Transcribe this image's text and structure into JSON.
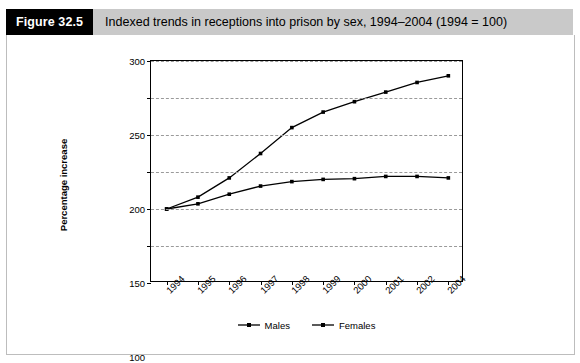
{
  "header": {
    "figure_label": "Figure 32.5",
    "figure_title": "Indexed trends in receptions into prison by sex, 1994–2004 (1994 = 100)"
  },
  "chart_data": {
    "type": "line",
    "title": "Indexed trends in receptions into prison by sex, 1994–2004 (1994 = 100)",
    "xlabel": "",
    "ylabel": "Percentage increase",
    "categories": [
      "1994",
      "1995",
      "1996",
      "1997",
      "1998",
      "1999",
      "2000",
      "2001",
      "2002",
      "2004"
    ],
    "ylim": [
      0,
      300
    ],
    "yticks": [
      0,
      50,
      100,
      150,
      200,
      250,
      300
    ],
    "grid": true,
    "legend_position": "bottom",
    "series": [
      {
        "name": "Males",
        "values": [
          100,
          107,
          120,
          131,
          137,
          140,
          141,
          144,
          144,
          142
        ]
      },
      {
        "name": "Females",
        "values": [
          100,
          116,
          142,
          175,
          210,
          231,
          245,
          258,
          271,
          280
        ]
      }
    ]
  },
  "legend": [
    {
      "label": "Males"
    },
    {
      "label": "Females"
    }
  ]
}
